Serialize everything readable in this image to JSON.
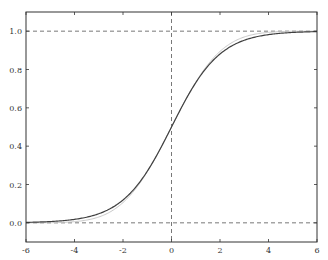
{
  "chart_data": {
    "type": "line",
    "title": "",
    "xlabel": "",
    "ylabel": "",
    "xlim": [
      -6,
      6
    ],
    "ylim": [
      -0.1,
      1.1
    ],
    "grid": false,
    "legend": null,
    "x_ticks": [
      "-6",
      "-4",
      "-2",
      "0",
      "2",
      "4",
      "6"
    ],
    "y_ticks": [
      "0.0",
      "0.2",
      "0.4",
      "0.6",
      "0.8",
      "1.0"
    ],
    "reference_lines": [
      {
        "orientation": "horizontal",
        "value": 0.0,
        "style": "dashed"
      },
      {
        "orientation": "horizontal",
        "value": 1.0,
        "style": "dashed"
      },
      {
        "orientation": "vertical",
        "value": 0.0,
        "style": "dashed"
      }
    ],
    "series": [
      {
        "name": "logistic sigmoid",
        "function": "1/(1+exp(-x))",
        "color": "#404040",
        "x": [
          -6,
          -5,
          -4,
          -3,
          -2,
          -1,
          0,
          1,
          2,
          3,
          4,
          5,
          6
        ],
        "values": [
          0.002,
          0.007,
          0.018,
          0.047,
          0.119,
          0.269,
          0.5,
          0.731,
          0.881,
          0.953,
          0.982,
          0.993,
          0.998
        ]
      },
      {
        "name": "normal CDF approximation",
        "function": "Phi(x/1.6)",
        "color": "#c8c8c8",
        "x": [
          -6,
          -5,
          -4,
          -3,
          -2,
          -1,
          0,
          1,
          2,
          3,
          4,
          5,
          6
        ],
        "values": [
          0.0,
          0.001,
          0.006,
          0.03,
          0.106,
          0.266,
          0.5,
          0.734,
          0.894,
          0.97,
          0.994,
          0.999,
          1.0
        ]
      }
    ]
  },
  "colors": {
    "axis": "#333333",
    "refline": "#555555"
  }
}
